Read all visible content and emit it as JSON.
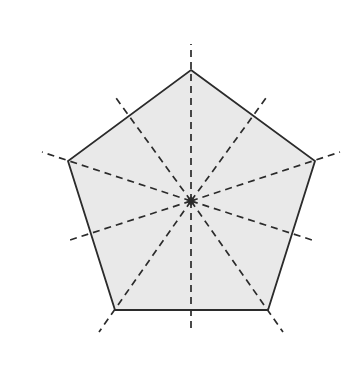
{
  "figure": {
    "shape_name": "regular-pentagon",
    "background_color": "#ffffff",
    "canvas": {
      "width": 354,
      "height": 372
    }
  },
  "polygon": {
    "name": "pentagon",
    "sides": 5,
    "fill_color": "#e9e9e9",
    "stroke_color": "#2b2b2b",
    "stroke_width": 1.8,
    "center": {
      "x": 191,
      "y": 201
    },
    "circumradius": 131,
    "rotation_degrees": -90,
    "vertices": [
      {
        "label": "top",
        "x": 191,
        "y": 70
      },
      {
        "label": "right",
        "x": 315,
        "y": 161
      },
      {
        "label": "bottom-right",
        "x": 268,
        "y": 310
      },
      {
        "label": "bottom-left",
        "x": 115,
        "y": 310
      },
      {
        "label": "left",
        "x": 68,
        "y": 161
      }
    ],
    "points_attr": "191,70 315,161 268,310 115,310 68,161"
  },
  "center_marker": {
    "name": "center-point",
    "x": 191,
    "y": 201,
    "color": "#2b2b2b",
    "radius": 2.2
  },
  "dashed_style": {
    "color": "#2b2b2b",
    "width": 1.7,
    "dash_array": "7,5",
    "extension_factor": 1.2
  },
  "chart_data": {
    "type": "diagram",
    "symmetry_axis_count": 5,
    "radial_line_count": 10,
    "interior_angle_degrees": 108,
    "central_angle_degrees": 72,
    "lines": [
      {
        "name": "line-to-vertex-top",
        "kind": "vertex",
        "angle_degrees": -90,
        "x1": 191,
        "y1": 201,
        "x2": 191,
        "y2": 44
      },
      {
        "name": "line-to-vertex-right",
        "kind": "vertex",
        "angle_degrees": -18,
        "x1": 191,
        "y1": 201,
        "x2": 340,
        "y2": 152
      },
      {
        "name": "line-to-vertex-bottom-right",
        "kind": "vertex",
        "angle_degrees": 54,
        "x1": 191,
        "y1": 201,
        "x2": 283,
        "y2": 332
      },
      {
        "name": "line-to-vertex-bottom-left",
        "kind": "vertex",
        "angle_degrees": 126,
        "x1": 191,
        "y1": 201,
        "x2": 99,
        "y2": 332
      },
      {
        "name": "line-to-vertex-left",
        "kind": "vertex",
        "angle_degrees": 198,
        "x1": 191,
        "y1": 201,
        "x2": 42,
        "y2": 152
      },
      {
        "name": "line-to-midpoint-upper-right",
        "kind": "midpoint",
        "angle_degrees": -54,
        "x1": 191,
        "y1": 201,
        "x2": 266,
        "y2": 98
      },
      {
        "name": "line-to-midpoint-lower-right",
        "kind": "midpoint",
        "angle_degrees": 18,
        "x1": 191,
        "y1": 201,
        "x2": 312,
        "y2": 240
      },
      {
        "name": "line-to-midpoint-bottom",
        "kind": "midpoint",
        "angle_degrees": 90,
        "x1": 191,
        "y1": 201,
        "x2": 191,
        "y2": 328
      },
      {
        "name": "line-to-midpoint-lower-left",
        "kind": "midpoint",
        "angle_degrees": 162,
        "x1": 191,
        "y1": 201,
        "x2": 70,
        "y2": 240
      },
      {
        "name": "line-to-midpoint-upper-left",
        "kind": "midpoint",
        "angle_degrees": 234,
        "x1": 191,
        "y1": 201,
        "x2": 116,
        "y2": 98
      }
    ],
    "edge_midpoints": [
      {
        "label": "upper-right",
        "x": 253,
        "y": 115
      },
      {
        "label": "lower-right",
        "x": 291,
        "y": 235
      },
      {
        "label": "bottom",
        "x": 191,
        "y": 310
      },
      {
        "label": "lower-left",
        "x": 91,
        "y": 235
      },
      {
        "label": "upper-left",
        "x": 129,
        "y": 115
      }
    ],
    "labels": [],
    "legend": []
  }
}
